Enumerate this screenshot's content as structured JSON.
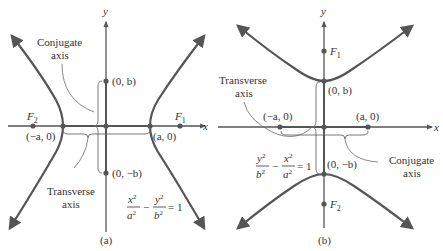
{
  "figure": {
    "panel_a": {
      "caption": "(a)",
      "x_axis_label": "x",
      "y_axis_label": "y",
      "point_labels": {
        "top": "(0, b)",
        "bottom": "(0, −b)",
        "left_vertex": "(−a, 0)",
        "right_vertex": "(a, 0)",
        "left_focus": "F",
        "left_focus_sub": "2",
        "right_focus": "F",
        "right_focus_sub": "1"
      },
      "annotations": {
        "conjugate_line1": "Conjugate",
        "conjugate_line2": "axis",
        "transverse_line1": "Transverse",
        "transverse_line2": "axis"
      },
      "equation": {
        "num1": "x",
        "den1": "a",
        "minus": "−",
        "num2": "y",
        "den2": "b",
        "exp": "2",
        "rhs": "= 1"
      }
    },
    "panel_b": {
      "caption": "(b)",
      "x_axis_label": "x",
      "y_axis_label": "y",
      "point_labels": {
        "top": "(0, b)",
        "bottom": "(0, −b)",
        "left": "(−a, 0)",
        "right": "(a, 0)",
        "top_focus": "F",
        "top_focus_sub": "1",
        "bottom_focus": "F",
        "bottom_focus_sub": "2"
      },
      "annotations": {
        "transverse_line1": "Transverse",
        "transverse_line2": "axis",
        "conjugate_line1": "Conjugate",
        "conjugate_line2": "axis"
      },
      "equation": {
        "num1": "y",
        "den1": "b",
        "minus": "−",
        "num2": "x",
        "den2": "a",
        "exp": "2",
        "rhs": "= 1"
      }
    }
  }
}
